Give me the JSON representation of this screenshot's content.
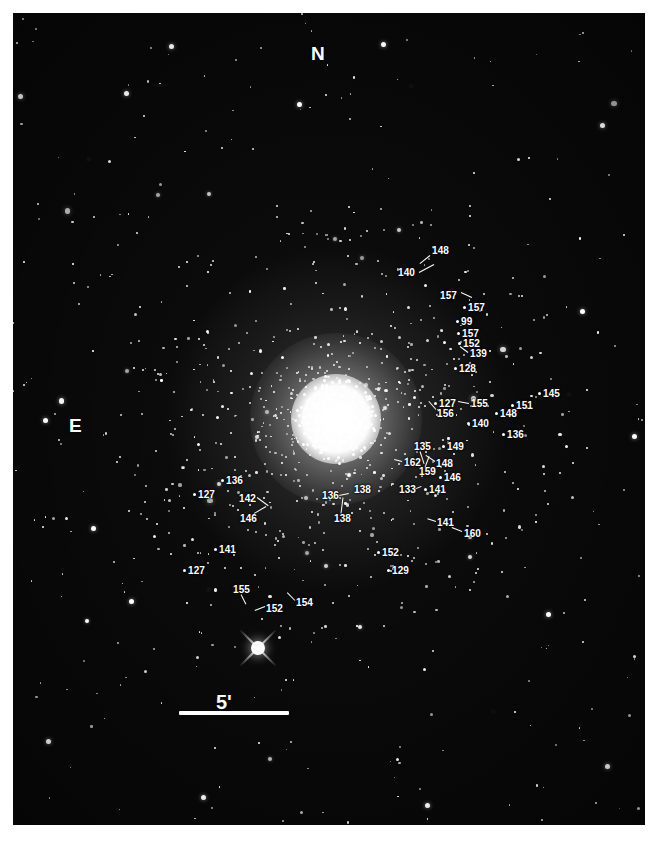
{
  "figure": {
    "kind": "astronomical-finding-chart",
    "background_color": "#080808",
    "border_color": "#ffffff",
    "star_color": "#ffffff",
    "label_color": "#ffffff"
  },
  "compass": {
    "north_label": "N",
    "north_x": 311,
    "north_y": 44,
    "east_label": "E",
    "east_x": 69,
    "east_y": 416
  },
  "scale_bar": {
    "label": "5'",
    "label_x": 216,
    "label_y": 692,
    "bar_x": 179,
    "bar_y": 711,
    "bar_length": 110
  },
  "cluster": {
    "center_x": 336,
    "center_y": 419,
    "core_radius": 36,
    "halo_radius": 150
  },
  "bright_star": {
    "name": "foreground-bright-star",
    "x": 258,
    "y": 648,
    "spike_length": 26
  },
  "labels": [
    {
      "id": "lbl-148-a",
      "text": "148",
      "x": 432,
      "y": 246,
      "dot": false,
      "leader": {
        "x1": 430,
        "y1": 255,
        "x2": 420,
        "y2": 263
      }
    },
    {
      "id": "lbl-140-a",
      "text": "140",
      "x": 398,
      "y": 268,
      "dot": false,
      "leader": {
        "x1": 419,
        "y1": 272,
        "x2": 434,
        "y2": 264
      }
    },
    {
      "id": "lbl-157-a",
      "text": "157",
      "x": 440,
      "y": 291,
      "dot": false,
      "leader": {
        "x1": 461,
        "y1": 292,
        "x2": 472,
        "y2": 297
      }
    },
    {
      "id": "lbl-157-b",
      "text": "157",
      "x": 468,
      "y": 303,
      "dot": true,
      "leader": null
    },
    {
      "id": "lbl-99",
      "text": "99",
      "x": 461,
      "y": 317,
      "dot": true,
      "leader": null
    },
    {
      "id": "lbl-157-c",
      "text": "157",
      "x": 462,
      "y": 329,
      "dot": true,
      "leader": null
    },
    {
      "id": "lbl-152-a",
      "text": "152",
      "x": 463,
      "y": 339,
      "dot": true,
      "leader": null
    },
    {
      "id": "lbl-139",
      "text": "139",
      "x": 470,
      "y": 349,
      "dot": false,
      "leader": {
        "x1": 468,
        "y1": 352,
        "x2": 460,
        "y2": 346
      }
    },
    {
      "id": "lbl-128",
      "text": "128",
      "x": 459,
      "y": 364,
      "dot": true,
      "leader": null
    },
    {
      "id": "lbl-145",
      "text": "145",
      "x": 543,
      "y": 389,
      "dot": true,
      "leader": null
    },
    {
      "id": "lbl-127-a",
      "text": "127",
      "x": 439,
      "y": 399,
      "dot": true,
      "leader": null
    },
    {
      "id": "lbl-155-a",
      "text": "155",
      "x": 471,
      "y": 399,
      "dot": false,
      "leader": {
        "x1": 469,
        "y1": 403,
        "x2": 458,
        "y2": 401
      }
    },
    {
      "id": "lbl-151",
      "text": "151",
      "x": 516,
      "y": 401,
      "dot": true,
      "leader": null
    },
    {
      "id": "lbl-156",
      "text": "156",
      "x": 437,
      "y": 409,
      "dot": false,
      "leader": {
        "x1": 436,
        "y1": 409,
        "x2": 429,
        "y2": 401
      }
    },
    {
      "id": "lbl-148-b",
      "text": "148",
      "x": 500,
      "y": 409,
      "dot": true,
      "leader": null
    },
    {
      "id": "lbl-140-b",
      "text": "140",
      "x": 472,
      "y": 419,
      "dot": true,
      "leader": null
    },
    {
      "id": "lbl-135",
      "text": "135",
      "x": 414,
      "y": 442,
      "dot": false,
      "leader": {
        "x1": 420,
        "y1": 451,
        "x2": 424,
        "y2": 463
      }
    },
    {
      "id": "lbl-149",
      "text": "149",
      "x": 447,
      "y": 442,
      "dot": true,
      "leader": null
    },
    {
      "id": "lbl-136-b",
      "text": "136",
      "x": 507,
      "y": 430,
      "dot": true,
      "leader": null
    },
    {
      "id": "lbl-162",
      "text": "162",
      "x": 404,
      "y": 458,
      "dot": false,
      "leader": {
        "x1": 402,
        "y1": 461,
        "x2": 394,
        "y2": 459
      }
    },
    {
      "id": "lbl-148-c",
      "text": "148",
      "x": 436,
      "y": 459,
      "dot": false,
      "leader": {
        "x1": 435,
        "y1": 461,
        "x2": 426,
        "y2": 455
      }
    },
    {
      "id": "lbl-159",
      "text": "159",
      "x": 419,
      "y": 467,
      "dot": false,
      "leader": {
        "x1": 425,
        "y1": 467,
        "x2": 429,
        "y2": 456
      }
    },
    {
      "id": "lbl-146-a",
      "text": "146",
      "x": 444,
      "y": 473,
      "dot": true,
      "leader": null
    },
    {
      "id": "lbl-133",
      "text": "133",
      "x": 399,
      "y": 485,
      "dot": false,
      "leader": {
        "x1": 414,
        "y1": 489,
        "x2": 421,
        "y2": 486
      }
    },
    {
      "id": "lbl-141-a",
      "text": "141",
      "x": 429,
      "y": 485,
      "dot": true,
      "leader": null
    },
    {
      "id": "lbl-138-a",
      "text": "138",
      "x": 354,
      "y": 485,
      "dot": false,
      "leader": null
    },
    {
      "id": "lbl-136-c",
      "text": "136",
      "x": 322,
      "y": 491,
      "dot": false,
      "leader": {
        "x1": 339,
        "y1": 495,
        "x2": 349,
        "y2": 493
      }
    },
    {
      "id": "lbl-136-a",
      "text": "136",
      "x": 226,
      "y": 476,
      "dot": true,
      "leader": null
    },
    {
      "id": "lbl-127-b",
      "text": "127",
      "x": 198,
      "y": 490,
      "dot": true,
      "leader": null
    },
    {
      "id": "lbl-142",
      "text": "142",
      "x": 239,
      "y": 494,
      "dot": false,
      "leader": {
        "x1": 257,
        "y1": 497,
        "x2": 268,
        "y2": 505
      }
    },
    {
      "id": "lbl-146-b",
      "text": "146",
      "x": 240,
      "y": 514,
      "dot": false,
      "leader": {
        "x1": 254,
        "y1": 513,
        "x2": 266,
        "y2": 506
      }
    },
    {
      "id": "lbl-138-b",
      "text": "138",
      "x": 334,
      "y": 514,
      "dot": false,
      "leader": {
        "x1": 341,
        "y1": 513,
        "x2": 343,
        "y2": 497
      }
    },
    {
      "id": "lbl-141-b",
      "text": "141",
      "x": 437,
      "y": 518,
      "dot": false,
      "leader": {
        "x1": 436,
        "y1": 521,
        "x2": 427,
        "y2": 518
      }
    },
    {
      "id": "lbl-160",
      "text": "160",
      "x": 464,
      "y": 529,
      "dot": false,
      "leader": {
        "x1": 462,
        "y1": 531,
        "x2": 452,
        "y2": 527
      }
    },
    {
      "id": "lbl-141-c",
      "text": "141",
      "x": 219,
      "y": 545,
      "dot": true,
      "leader": null
    },
    {
      "id": "lbl-152-c",
      "text": "152",
      "x": 382,
      "y": 548,
      "dot": true,
      "leader": null
    },
    {
      "id": "lbl-127-c",
      "text": "127",
      "x": 188,
      "y": 566,
      "dot": true,
      "leader": null
    },
    {
      "id": "lbl-129",
      "text": "129",
      "x": 392,
      "y": 566,
      "dot": true,
      "leader": null
    },
    {
      "id": "lbl-155-b",
      "text": "155",
      "x": 233,
      "y": 585,
      "dot": false,
      "leader": {
        "x1": 241,
        "y1": 594,
        "x2": 246,
        "y2": 604
      }
    },
    {
      "id": "lbl-154",
      "text": "154",
      "x": 296,
      "y": 598,
      "dot": false,
      "leader": {
        "x1": 295,
        "y1": 600,
        "x2": 287,
        "y2": 592
      }
    },
    {
      "id": "lbl-152-b",
      "text": "152",
      "x": 266,
      "y": 604,
      "dot": false,
      "leader": {
        "x1": 265,
        "y1": 606,
        "x2": 255,
        "y2": 610
      }
    }
  ],
  "chart_data": {
    "type": "scatter",
    "xlabel": "",
    "ylabel": "",
    "annotations": [
      "N",
      "E",
      "5'"
    ],
    "star_count_rendered": 520,
    "identified_stars": [
      "148",
      "140",
      "157",
      "157",
      "99",
      "157",
      "152",
      "139",
      "128",
      "145",
      "127",
      "155",
      "151",
      "156",
      "148",
      "140",
      "135",
      "149",
      "136",
      "162",
      "148",
      "159",
      "146",
      "133",
      "141",
      "138",
      "136",
      "136",
      "127",
      "142",
      "146",
      "138",
      "141",
      "160",
      "141",
      "152",
      "127",
      "129",
      "155",
      "154",
      "152"
    ]
  }
}
